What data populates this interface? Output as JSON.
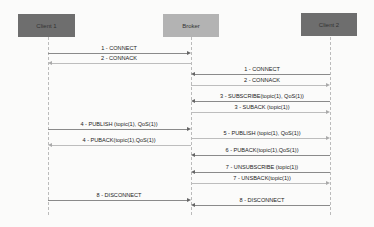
{
  "participants": [
    {
      "label": "Client 1",
      "color": "#6e6e6e"
    },
    {
      "label": "Broker",
      "color": "#b3b3b3"
    },
    {
      "label": "Client 2",
      "color": "#6e6e6e"
    }
  ],
  "messages": [
    {
      "label": "1 - CONNECT",
      "from": "Client 1",
      "to": "Broker"
    },
    {
      "label": "2 - CONNACK",
      "from": "Broker",
      "to": "Client 1"
    },
    {
      "label": "1 - CONNECT",
      "from": "Client 2",
      "to": "Broker"
    },
    {
      "label": "2 - CONNACK",
      "from": "Broker",
      "to": "Client 2"
    },
    {
      "label": "3 - SUBSCRIBE(topic(1), QoS(1))",
      "from": "Client 2",
      "to": "Broker"
    },
    {
      "label": "3 - SUBACK (topic(1))",
      "from": "Broker",
      "to": "Client 2"
    },
    {
      "label": "4 - PUBLISH (topic(1), QoS(1))",
      "from": "Client 1",
      "to": "Broker"
    },
    {
      "label": "5 - PUBLISH (topic(1), QoS(1))",
      "from": "Broker",
      "to": "Client 2"
    },
    {
      "label": "4 - PUBACK(topic(1),QoS(1))",
      "from": "Broker",
      "to": "Client 1"
    },
    {
      "label": "6 - PUBACK(topic(1),QoS(1))",
      "from": "Client 2",
      "to": "Broker"
    },
    {
      "label": "7 - UNSUBSCRIBE (topic(1))",
      "from": "Client 2",
      "to": "Broker"
    },
    {
      "label": "7 - UNSBACK(topic(1))",
      "from": "Broker",
      "to": "Client 2"
    },
    {
      "label": "8 - DISCONNECT",
      "from": "Client 1",
      "to": "Broker"
    },
    {
      "label": "8 - DISCONNECT",
      "from": "Client 2",
      "to": "Broker"
    }
  ]
}
